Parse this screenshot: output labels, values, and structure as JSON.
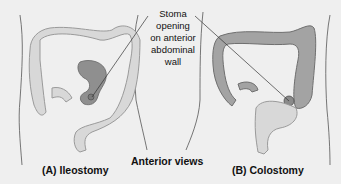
{
  "figure": {
    "callout": {
      "lines": [
        "Stoma",
        "opening",
        "on anterior",
        "abdominal",
        "wall"
      ]
    },
    "panels": [
      {
        "id": "A",
        "caption": "(A) Ileostomy",
        "highlight_color": "#8f8f8f"
      },
      {
        "id": "B",
        "caption": "(B) Colostomy",
        "highlight_color": "#a3a3a3"
      }
    ],
    "center_caption": "Anterior views",
    "colors": {
      "background": "#efefef",
      "colon_light": "#d6d6d6",
      "colon_outline": "#9a9a9a",
      "colon_dark": "#9c9c9c",
      "body_outline": "#555555"
    }
  }
}
